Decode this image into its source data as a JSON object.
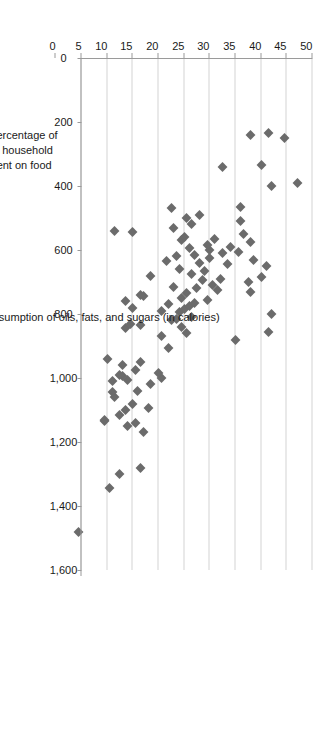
{
  "chart_data": {
    "type": "scatter",
    "title": "",
    "xlabel": "Daily average per capita consumption of oils, fats, and sugars (in calories)",
    "ylabel": "Average percentage of disposable household income spent on food",
    "ylabel_lines": [
      "Average percentage of",
      "disposable household",
      "income spent on food"
    ],
    "xlim": [
      0,
      1600
    ],
    "ylim": [
      0,
      50
    ],
    "y_axis_inverted": true,
    "grid": "vertical-gridlines-on-value-axis",
    "legend": "none",
    "orientation": "rotated-90-degrees",
    "marker": {
      "shape": "diamond",
      "color": "#6b6b6b",
      "size_px": 7
    },
    "xticks": [
      0,
      200,
      400,
      600,
      800,
      1000,
      1200,
      1400,
      1600
    ],
    "xticklabels": [
      "0",
      "200",
      "400",
      "600",
      "800",
      "1,000",
      "1,200",
      "1,400",
      "1,600"
    ],
    "yticks": [
      50,
      45,
      40,
      35,
      30,
      25,
      20,
      15,
      10,
      5,
      0
    ],
    "yticklabels": [
      "50",
      "45",
      "40",
      "35",
      "30",
      "25",
      "20",
      "15",
      "10",
      "5",
      "0"
    ],
    "x": [
      1480,
      1345,
      1300,
      1280,
      1170,
      1150,
      1140,
      1135,
      1130,
      1115,
      1100,
      1095,
      1080,
      1060,
      1045,
      1040,
      1020,
      1010,
      1005,
      1000,
      995,
      990,
      985,
      975,
      960,
      950,
      940,
      905,
      880,
      870,
      860,
      855,
      845,
      840,
      835,
      830,
      820,
      815,
      810,
      800,
      795,
      790,
      785,
      780,
      775,
      770,
      765,
      760,
      755,
      750,
      745,
      740,
      735,
      730,
      725,
      720,
      715,
      710,
      700,
      695,
      690,
      685,
      680,
      675,
      665,
      660,
      650,
      645,
      640,
      635,
      630,
      625,
      620,
      615,
      610,
      605,
      600,
      595,
      590,
      585,
      575,
      570,
      565,
      560,
      550,
      545,
      540,
      530,
      520,
      510,
      500,
      490,
      470,
      465,
      400,
      390,
      340,
      335,
      250,
      240,
      235
    ],
    "y": [
      4.5,
      10.5,
      12.5,
      16.5,
      17.0,
      14.0,
      15.5,
      9.5,
      9.5,
      12.5,
      13.5,
      18.0,
      15.0,
      11.5,
      11.0,
      16.0,
      18.5,
      11.0,
      14.0,
      20.5,
      13.0,
      12.5,
      20.0,
      15.5,
      13.0,
      16.5,
      10.0,
      22.0,
      35.0,
      20.5,
      25.5,
      41.5,
      13.5,
      24.5,
      16.5,
      14.5,
      22.5,
      23.5,
      26.5,
      42.0,
      24.0,
      20.5,
      25.0,
      15.0,
      26.0,
      22.0,
      27.0,
      13.5,
      29.5,
      24.5,
      17.0,
      16.5,
      25.5,
      38.0,
      31.5,
      27.5,
      23.0,
      30.5,
      37.5,
      28.5,
      32.0,
      40.0,
      18.5,
      26.5,
      29.0,
      24.0,
      41.0,
      33.5,
      28.0,
      21.5,
      38.5,
      30.0,
      23.5,
      27.0,
      32.5,
      35.5,
      30.0,
      26.0,
      34.0,
      29.5,
      38.0,
      24.5,
      31.0,
      25.0,
      36.5,
      15.0,
      11.5,
      23.0,
      26.5,
      36.0,
      25.5,
      28.0,
      22.5,
      36.0,
      42.0,
      47.0,
      32.5,
      40.0,
      44.5,
      38.0,
      41.5
    ]
  }
}
